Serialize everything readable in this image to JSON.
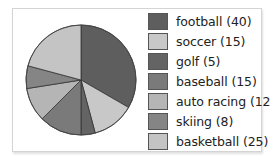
{
  "chart_data": {
    "type": "pie",
    "title": "",
    "start_angle_deg": 0,
    "direction": "clockwise",
    "legend_position": "right",
    "categories": [
      "football",
      "soccer",
      "golf",
      "baseball",
      "auto racing",
      "skiing",
      "basketball"
    ],
    "values": [
      40,
      15,
      5,
      15,
      12,
      8,
      25
    ],
    "colors": [
      "#5e5e5e",
      "#c8c8c8",
      "#646464",
      "#7a7a7a",
      "#b5b5b5",
      "#858585",
      "#c4c4c4"
    ],
    "total": 120
  },
  "legend": {
    "items": [
      {
        "label": "football (40)",
        "color": "#5e5e5e"
      },
      {
        "label": "soccer (15)",
        "color": "#c8c8c8"
      },
      {
        "label": "golf (5)",
        "color": "#646464"
      },
      {
        "label": "baseball (15)",
        "color": "#7a7a7a"
      },
      {
        "label": "auto racing (12)",
        "color": "#b5b5b5"
      },
      {
        "label": "skiing (8)",
        "color": "#858585"
      },
      {
        "label": "basketball (25)",
        "color": "#c4c4c4"
      }
    ]
  }
}
